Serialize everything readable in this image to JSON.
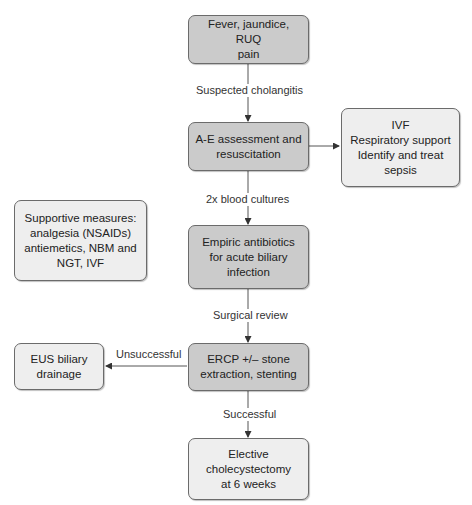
{
  "colors": {
    "primary_box": "#cbcbcb",
    "secondary_box": "#eeeeee",
    "border": "#6b6b6b",
    "arrow": "#333333"
  },
  "nodes": {
    "presentation": "Fever, jaundice, RUQ\npain",
    "assessment": "A-E assessment and\nresuscitation",
    "resus_details": "IVF\nRespiratory support\nIdentify and treat\nsepsis",
    "supportive": "Supportive measures:\nanalgesia (NSAIDs)\nantiemetics, NBM and\nNGT, IVF",
    "antibiotics": "Empiric antibiotics\nfor acute biliary\ninfection",
    "ercp": "ERCP +/– stone\nextraction, stenting",
    "eus": "EUS biliary\ndrainage",
    "cholecystectomy": "Elective\ncholecystectomy\nat 6 weeks"
  },
  "edges": {
    "suspected": "Suspected cholangitis",
    "cultures": "2x blood cultures",
    "surgical": "Surgical review",
    "unsuccessful": "Unsuccessful",
    "successful": "Successful"
  }
}
